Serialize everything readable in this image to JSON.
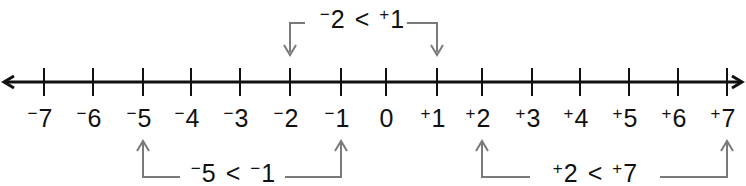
{
  "diagram": {
    "axis": {
      "min": -7,
      "max": 7,
      "arrows": "both",
      "color": "#111111"
    },
    "ticks": [
      {
        "value": -7,
        "sign": "−",
        "num": "7",
        "x": 44
      },
      {
        "value": -6,
        "sign": "−",
        "num": "6",
        "x": 93
      },
      {
        "value": -5,
        "sign": "−",
        "num": "5",
        "x": 143
      },
      {
        "value": -4,
        "sign": "−",
        "num": "4",
        "x": 191
      },
      {
        "value": -3,
        "sign": "−",
        "num": "3",
        "x": 240
      },
      {
        "value": -2,
        "sign": "−",
        "num": "2",
        "x": 290
      },
      {
        "value": -1,
        "sign": "−",
        "num": "1",
        "x": 341
      },
      {
        "value": 0,
        "sign": "",
        "num": "0",
        "x": 386
      },
      {
        "value": 1,
        "sign": "+",
        "num": "1",
        "x": 437
      },
      {
        "value": 2,
        "sign": "+",
        "num": "2",
        "x": 482
      },
      {
        "value": 3,
        "sign": "+",
        "num": "3",
        "x": 532
      },
      {
        "value": 4,
        "sign": "+",
        "num": "4",
        "x": 580
      },
      {
        "value": 5,
        "sign": "+",
        "num": "5",
        "x": 629
      },
      {
        "value": 6,
        "sign": "+",
        "num": "6",
        "x": 678
      },
      {
        "value": 7,
        "sign": "+",
        "num": "7",
        "x": 727
      }
    ],
    "comparisons": [
      {
        "id": "top",
        "left_sign": "−",
        "left_num": "2",
        "op": "<",
        "right_sign": "+",
        "right_num": "1",
        "from": -2,
        "to": 1,
        "position": "above"
      },
      {
        "id": "bottom-left",
        "left_sign": "−",
        "left_num": "5",
        "op": "<",
        "right_sign": "−",
        "right_num": "1",
        "from": -5,
        "to": -1,
        "position": "below"
      },
      {
        "id": "bottom-right",
        "left_sign": "+",
        "left_num": "2",
        "op": "<",
        "right_sign": "+",
        "right_num": "7",
        "from": 2,
        "to": 7,
        "position": "below"
      }
    ],
    "bracket_color": "#7a7a7a"
  }
}
